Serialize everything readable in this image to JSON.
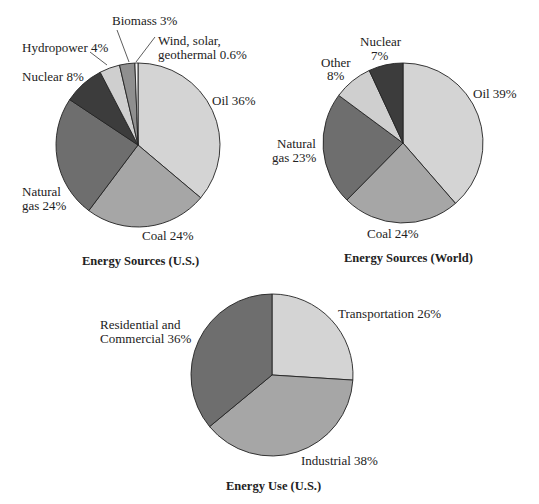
{
  "chart_data": [
    {
      "type": "pie",
      "title": "Energy Sources (U.S.)",
      "categories": [
        "Oil",
        "Coal",
        "Natural gas",
        "Nuclear",
        "Hydropower",
        "Biomass",
        "Wind, solar, geothermal"
      ],
      "values": [
        36,
        24,
        24,
        8,
        4,
        3,
        0.6
      ],
      "labels": [
        "Oil 36%",
        "Coal 24%",
        "Natural gas 24%",
        "Nuclear 8%",
        "Hydropower 4%",
        "Biomass 3%",
        "Wind, solar, geothermal 0.6%"
      ],
      "colors": [
        "#d4d4d4",
        "#a6a6a6",
        "#6e6e6e",
        "#3c3c3c",
        "#cfcfcf",
        "#8f8f8f",
        "#f4f4f4"
      ],
      "center": [
        138,
        145
      ],
      "radius": 82
    },
    {
      "type": "pie",
      "title": "Energy Sources (World)",
      "categories": [
        "Oil",
        "Coal",
        "Natural gas",
        "Other",
        "Nuclear"
      ],
      "values": [
        39,
        24,
        23,
        8,
        7
      ],
      "labels": [
        "Oil 39%",
        "Coal 24%",
        "Natural gas 23%",
        "Other 8%",
        "Nuclear 7%"
      ],
      "colors": [
        "#d4d4d4",
        "#a6a6a6",
        "#6e6e6e",
        "#cfcfcf",
        "#3c3c3c"
      ],
      "center": [
        403,
        143
      ],
      "radius": 80
    },
    {
      "type": "pie",
      "title": "Energy Use (U.S.)",
      "categories": [
        "Transportation",
        "Industrial",
        "Residential and Commercial"
      ],
      "values": [
        26,
        38,
        36
      ],
      "labels": [
        "Transportation 26%",
        "Industrial 38%",
        "Residential and Commercial 36%"
      ],
      "colors": [
        "#d4d4d4",
        "#a6a6a6",
        "#6e6e6e"
      ],
      "center": [
        272,
        375
      ],
      "radius": 81
    }
  ],
  "text": {
    "us_sources": {
      "title": "Energy Sources (U.S.)",
      "oil": "Oil 36%",
      "coal": "Coal 24%",
      "gas_1": "Natural",
      "gas_2": "gas 24%",
      "nuclear": "Nuclear 8%",
      "hydro": "Hydropower 4%",
      "biomass": "Biomass 3%",
      "wind_1": "Wind, solar,",
      "wind_2": "geothermal 0.6%"
    },
    "world_sources": {
      "title": "Energy Sources (World)",
      "oil": "Oil 39%",
      "coal": "Coal 24%",
      "gas_1": "Natural",
      "gas_2": "gas 23%",
      "other_1": "Other",
      "other_2": "8%",
      "nuclear_1": "Nuclear",
      "nuclear_2": "7%"
    },
    "us_use": {
      "title": "Energy Use (U.S.)",
      "transport": "Transportation 26%",
      "industrial": "Industrial 38%",
      "res_1": "Residential and",
      "res_2": "Commercial 36%"
    }
  }
}
